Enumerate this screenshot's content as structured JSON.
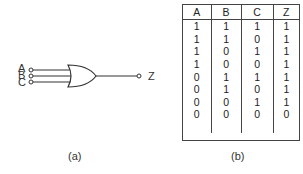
{
  "figure_a": {
    "inputs": [
      "A",
      "B",
      "C"
    ],
    "output": "Z",
    "caption": "(a)"
  },
  "figure_b": {
    "headers": [
      "A",
      "B",
      "C",
      "Z"
    ],
    "rows": [
      [
        "1",
        "1",
        "1",
        "1"
      ],
      [
        "1",
        "1",
        "0",
        "1"
      ],
      [
        "1",
        "0",
        "1",
        "1"
      ],
      [
        "1",
        "0",
        "0",
        "1"
      ],
      [
        "0",
        "1",
        "1",
        "1"
      ],
      [
        "0",
        "1",
        "0",
        "1"
      ],
      [
        "0",
        "0",
        "1",
        "1"
      ],
      [
        "0",
        "0",
        "0",
        "0"
      ]
    ],
    "caption": "(b)"
  }
}
